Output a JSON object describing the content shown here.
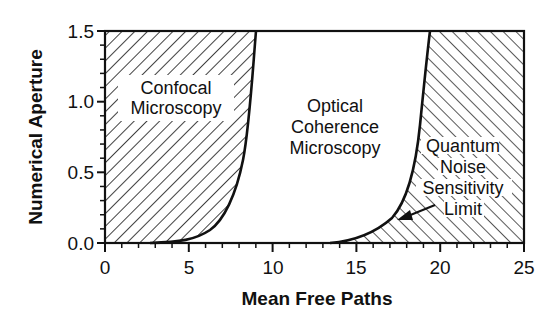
{
  "chart_data": {
    "type": "area",
    "title": "",
    "xlabel": "Mean Free Paths",
    "ylabel": "Numerical Aperture",
    "xlim": [
      0,
      25
    ],
    "ylim": [
      0.0,
      1.5
    ],
    "x_ticks": [
      "0",
      "5",
      "10",
      "15",
      "20",
      "25"
    ],
    "y_ticks": [
      "0.0",
      "0.5",
      "1.0",
      "1.5"
    ],
    "grid": false,
    "legend": null,
    "series": [
      {
        "name": "Confocal limit boundary",
        "x": [
          0,
          4.8,
          6.6,
          7.6,
          8.3,
          8.7,
          9.0
        ],
        "y": [
          0.0,
          0.02,
          0.13,
          0.31,
          0.59,
          0.94,
          1.5
        ]
      },
      {
        "name": "Quantum noise sensitivity limit boundary",
        "x": [
          13.5,
          15.2,
          16.7,
          17.6,
          18.2,
          18.7,
          19.0,
          19.4
        ],
        "y": [
          0.0,
          0.04,
          0.13,
          0.27,
          0.45,
          0.73,
          1.08,
          1.5
        ]
      }
    ],
    "regions": [
      {
        "label": "Confocal Microscopy",
        "fill": "hatched-backslash"
      },
      {
        "label": "Optical Coherence Microscopy",
        "fill": "none"
      },
      {
        "label": "Quantum Noise Sensitivity Limit",
        "fill": "hatched-slash"
      }
    ],
    "annotations": [
      "Confocal",
      "Microscopy",
      "Optical",
      "Coherence",
      "Microscopy",
      "Quantum",
      "Noise",
      "Sensitivity",
      "Limit"
    ]
  },
  "labels": {
    "confocal": [
      "Confocal",
      "Microscopy"
    ],
    "ocm": [
      "Optical",
      "Coherence",
      "Microscopy"
    ],
    "quantum": [
      "Quantum",
      "Noise",
      "Sensitivity",
      "Limit"
    ]
  },
  "colors": {
    "ink": "#111111",
    "background": "#ffffff"
  }
}
